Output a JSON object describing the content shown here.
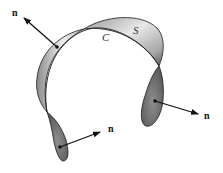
{
  "figure": {
    "surface_label": "S",
    "curve_label": "C",
    "normals": [
      {
        "label": "n",
        "position": "upper-left"
      },
      {
        "label": "n",
        "position": "right"
      },
      {
        "label": "n",
        "position": "lower-left"
      }
    ]
  },
  "colors": {
    "background": "#ffffff",
    "outline": "#1a1a1a",
    "band_light": "#f2f2f2",
    "band_mid": "#b5b5b5",
    "band_dark": "#6e6e6e",
    "lobe_fill": "#7a7a7a",
    "arrow": "#111111"
  }
}
